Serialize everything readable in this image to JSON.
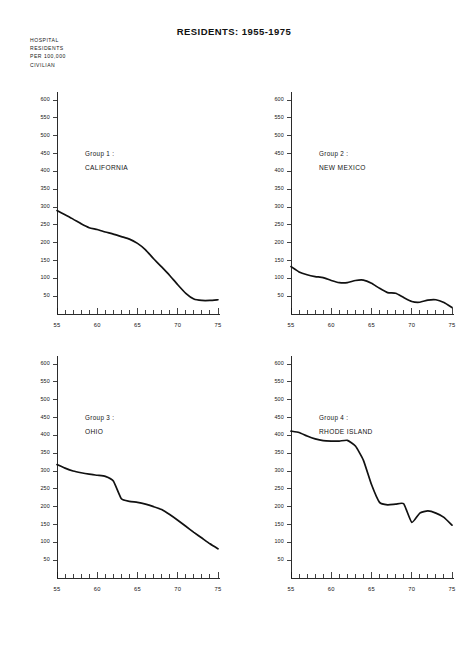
{
  "figure": {
    "title": "RESIDENTS: 1955-1975",
    "axis_caption": [
      "HOSPITAL",
      "RESIDENTS",
      "PER 100,000",
      "CIVILIAN"
    ]
  },
  "chart_data": [
    {
      "type": "line",
      "title": "Group 1 :",
      "subtitle": "CALIFORNIA",
      "panel": 1,
      "xlabel": "",
      "ylabel": "HOSPITAL RESIDENTS PER 100,000 CIVILIAN",
      "xlim": [
        55,
        75
      ],
      "ylim": [
        0,
        600
      ],
      "yticks": [
        50,
        100,
        150,
        200,
        250,
        300,
        350,
        400,
        450,
        500,
        550,
        600
      ],
      "xticks": [
        55,
        60,
        65,
        70,
        75
      ],
      "xtick_labels": [
        "55",
        "60",
        "65",
        "70",
        "75"
      ],
      "x_minor_step": 1,
      "grid": false,
      "legend": "none",
      "x": [
        55,
        56,
        57,
        58,
        59,
        60,
        61,
        62,
        63,
        64,
        65,
        66,
        67,
        68,
        69,
        70,
        71,
        72,
        73,
        74,
        75
      ],
      "values": [
        290,
        278,
        266,
        253,
        242,
        237,
        230,
        224,
        217,
        210,
        198,
        180,
        155,
        132,
        108,
        82,
        58,
        42,
        38,
        38,
        40
      ]
    },
    {
      "type": "line",
      "title": "Group 2 :",
      "subtitle": "NEW MEXICO",
      "panel": 2,
      "xlabel": "",
      "ylabel": "HOSPITAL RESIDENTS PER 100,000 CIVILIAN",
      "xlim": [
        55,
        75
      ],
      "ylim": [
        0,
        600
      ],
      "yticks": [
        50,
        100,
        150,
        200,
        250,
        300,
        350,
        400,
        450,
        500,
        550,
        600
      ],
      "xticks": [
        55,
        60,
        65,
        70,
        75
      ],
      "xtick_labels": [
        "55",
        "60",
        "65",
        "70",
        "75"
      ],
      "x_minor_step": 1,
      "grid": false,
      "legend": "none",
      "x": [
        55,
        56,
        57,
        58,
        59,
        60,
        61,
        62,
        63,
        64,
        65,
        66,
        67,
        68,
        69,
        70,
        71,
        72,
        73,
        74,
        75
      ],
      "values": [
        133,
        118,
        110,
        105,
        102,
        94,
        88,
        88,
        94,
        95,
        86,
        72,
        60,
        58,
        46,
        35,
        33,
        39,
        40,
        32,
        18
      ]
    },
    {
      "type": "line",
      "title": "Group 3 :",
      "subtitle": "OHIO",
      "panel": 3,
      "xlabel": "",
      "ylabel": "HOSPITAL RESIDENTS PER 100,000 CIVILIAN",
      "xlim": [
        55,
        75
      ],
      "ylim": [
        0,
        600
      ],
      "yticks": [
        50,
        100,
        150,
        200,
        250,
        300,
        350,
        400,
        450,
        500,
        550,
        600
      ],
      "xticks": [
        55,
        60,
        65,
        70,
        75
      ],
      "xtick_labels": [
        "55",
        "60",
        "65",
        "70",
        "75"
      ],
      "x_minor_step": 1,
      "grid": false,
      "legend": "none",
      "x": [
        55,
        56,
        57,
        58,
        59,
        60,
        61,
        62,
        63,
        64,
        65,
        66,
        67,
        68,
        69,
        70,
        71,
        72,
        73,
        74,
        75
      ],
      "values": [
        318,
        308,
        300,
        295,
        291,
        288,
        285,
        272,
        222,
        215,
        212,
        207,
        200,
        192,
        178,
        162,
        145,
        128,
        112,
        96,
        82
      ]
    },
    {
      "type": "line",
      "title": "Group 4 :",
      "subtitle": "RHODE ISLAND",
      "panel": 4,
      "xlabel": "",
      "ylabel": "HOSPITAL RESIDENTS PER 100,000 CIVILIAN",
      "xlim": [
        55,
        75
      ],
      "ylim": [
        0,
        600
      ],
      "yticks": [
        50,
        100,
        150,
        200,
        250,
        300,
        350,
        400,
        450,
        500,
        550,
        600
      ],
      "xticks": [
        55,
        60,
        65,
        70,
        75
      ],
      "xtick_labels": [
        "55",
        "60",
        "65",
        "70",
        "75"
      ],
      "x_minor_step": 1,
      "grid": false,
      "legend": "none",
      "x": [
        55,
        56,
        57,
        58,
        59,
        60,
        61,
        62,
        63,
        64,
        65,
        66,
        67,
        68,
        69,
        70,
        71,
        72,
        73,
        74,
        75
      ],
      "values": [
        412,
        408,
        398,
        390,
        385,
        384,
        384,
        386,
        370,
        330,
        262,
        212,
        205,
        207,
        208,
        156,
        182,
        188,
        182,
        170,
        148
      ]
    }
  ]
}
